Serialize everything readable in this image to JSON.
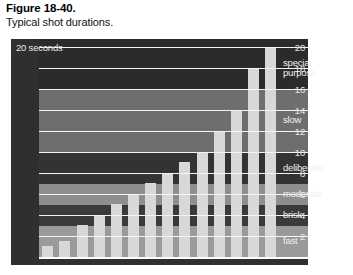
{
  "caption": {
    "figure_number": "Figure 18-40.",
    "description": "Typical shot durations."
  },
  "colors": {
    "figure_background": "#2f2f2f",
    "bar": "#d8d8d8",
    "gridline": "#f4f4f4",
    "band_fast": "#9a9a9a",
    "band_brisk": "#3a3a3a",
    "band_moderate": "#8e8e8e",
    "band_deliberate": "#333333",
    "band_slow": "#6e6e6e",
    "band_special": "#2b2b2b",
    "axis_text": "#e9e9e9"
  },
  "chart_data": {
    "type": "bar",
    "title": "Typical shot durations.",
    "xlabel": "",
    "ylabel": "seconds",
    "unit_label": "20 seconds",
    "ylim": [
      0,
      20
    ],
    "grid": true,
    "yticks": [
      20,
      18,
      16,
      14,
      12,
      10,
      8,
      6,
      4,
      2
    ],
    "ytick_labels": [
      "20",
      "18",
      "16",
      "14",
      "12",
      "10",
      "8",
      "6",
      "4",
      "2"
    ],
    "categories": [
      "1",
      "2",
      "3",
      "4",
      "5",
      "6",
      "7",
      "8",
      "9",
      "10",
      "11",
      "12",
      "13",
      "14"
    ],
    "values": [
      1,
      1.5,
      3,
      4,
      5,
      6,
      7,
      8,
      9,
      10,
      12,
      14,
      18,
      20
    ],
    "bands": [
      {
        "name": "fast",
        "label": "fast",
        "from": 0,
        "to": 3
      },
      {
        "name": "brisk",
        "label": "brisk",
        "from": 3,
        "to": 5
      },
      {
        "name": "moderate",
        "label": "moderate",
        "from": 5,
        "to": 7
      },
      {
        "name": "deliberate",
        "label": "deliberate",
        "from": 7,
        "to": 10
      },
      {
        "name": "slow",
        "label": "slow",
        "from": 10,
        "to": 16
      },
      {
        "name": "special purpose",
        "label": "special\npurpose",
        "from": 16,
        "to": 20
      }
    ]
  }
}
